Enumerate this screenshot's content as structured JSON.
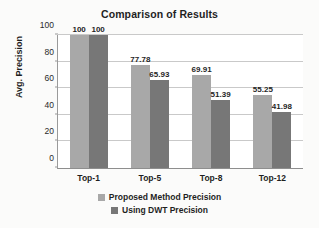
{
  "chart_data": {
    "type": "bar",
    "title": "Comparison of Results",
    "xlabel": "",
    "ylabel": "Avg. Precision",
    "categories": [
      "Top-1",
      "Top-5",
      "Top-8",
      "Top-12"
    ],
    "series": [
      {
        "name": "Proposed Method Precision",
        "color": "#a8a8a8",
        "values": [
          100,
          77.78,
          69.91,
          55.25
        ],
        "labels": [
          "100",
          "77.78",
          "69.91",
          "55.25"
        ]
      },
      {
        "name": "Using DWT Precision",
        "color": "#777777",
        "values": [
          100,
          65.93,
          51.39,
          41.98
        ],
        "labels": [
          "100",
          "65.93",
          "51.39",
          "41.98"
        ]
      }
    ],
    "ylim": [
      0,
      100
    ],
    "yticks": [
      0,
      20,
      40,
      60,
      80,
      100
    ],
    "ytick_labels": [
      "0",
      "20",
      "40",
      "60",
      "80",
      "100"
    ],
    "grid": "horizontal",
    "legend_position": "bottom"
  }
}
